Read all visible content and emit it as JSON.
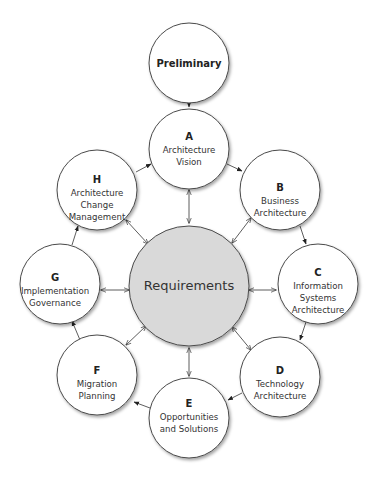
{
  "diagram": {
    "colors": {
      "node_fill": "#ffffff",
      "center_fill": "#d9d9d9",
      "stroke": "#4a4a4a"
    },
    "preliminary": {
      "label": "Preliminary"
    },
    "center": {
      "label": "Requirements"
    },
    "phases": [
      {
        "letter": "A",
        "lines": [
          "Architecture",
          "Vision"
        ]
      },
      {
        "letter": "B",
        "lines": [
          "Business",
          "Architecture"
        ]
      },
      {
        "letter": "C",
        "lines": [
          "Information",
          "Systems",
          "Architecture"
        ]
      },
      {
        "letter": "D",
        "lines": [
          "Technology",
          "Architecture"
        ]
      },
      {
        "letter": "E",
        "lines": [
          "Opportunities",
          "and Solutions"
        ]
      },
      {
        "letter": "F",
        "lines": [
          "Migration",
          "Planning"
        ]
      },
      {
        "letter": "G",
        "lines": [
          "Implementation",
          "Governance"
        ]
      },
      {
        "letter": "H",
        "lines": [
          "Architecture",
          "Change",
          "Management"
        ]
      }
    ]
  }
}
